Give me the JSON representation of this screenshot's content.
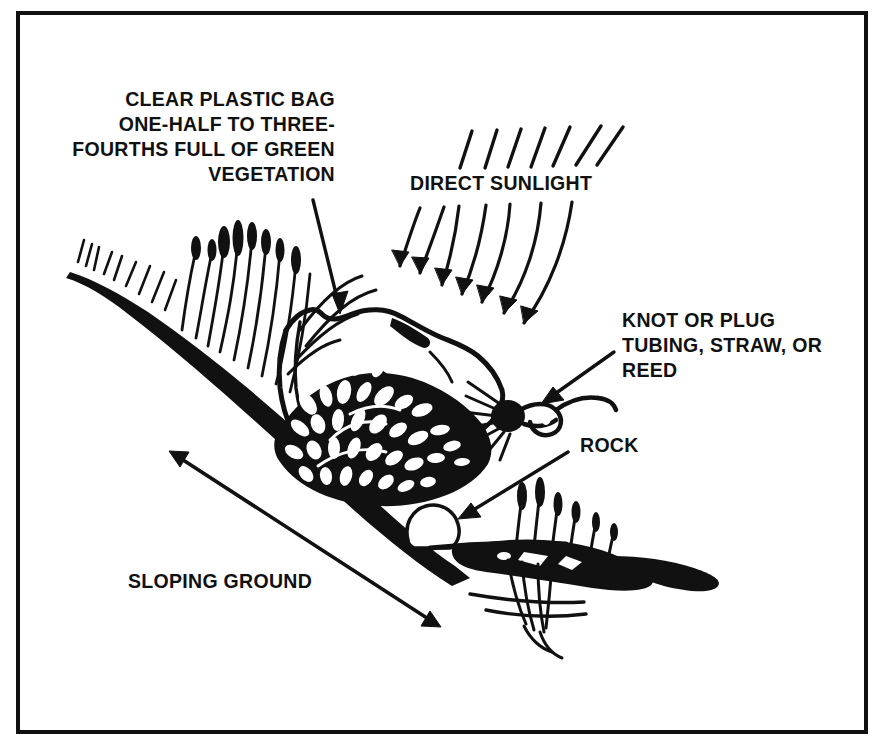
{
  "figure": {
    "background_color": "#ffffff",
    "ink_color": "#111111",
    "border": {
      "name": "figure-border",
      "color": "#111111",
      "thickness_px": 4
    }
  },
  "labels": {
    "plastic_bag": {
      "name": "label-clear-plastic-bag",
      "align": "right",
      "lines": [
        "CLEAR PLASTIC BAG",
        "ONE-HALF TO THREE-",
        "FOURTHS FULL OF GREEN",
        "VEGETATION"
      ]
    },
    "direct_sunlight": {
      "name": "label-direct-sunlight",
      "align": "left",
      "lines": [
        "DIRECT SUNLIGHT"
      ]
    },
    "knot_or_plug": {
      "name": "label-knot-or-plug",
      "align": "left",
      "lines": [
        "KNOT OR PLUG",
        "TUBING, STRAW, OR",
        "REED"
      ]
    },
    "rock": {
      "name": "label-rock",
      "align": "left",
      "lines": [
        "ROCK"
      ]
    },
    "sloping_ground": {
      "name": "label-sloping-ground",
      "align": "left",
      "lines": [
        "SLOPING GROUND"
      ]
    }
  },
  "annotations": {
    "sun_rays_count": 7,
    "sun_arrows_count": 7,
    "leader_arrows": [
      "plastic-bag-leader-arrow",
      "knot-leader-arrow",
      "rock-leader-arrow",
      "sloping-ground-double-arrow"
    ]
  }
}
